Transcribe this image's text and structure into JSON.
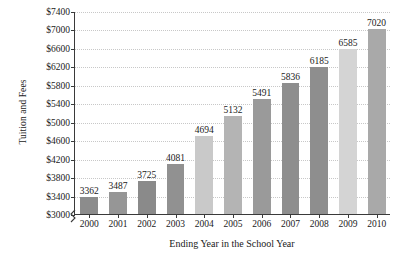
{
  "chart_data": {
    "type": "bar",
    "title": "",
    "xlabel": "Ending Year in the School Year",
    "ylabel": "Tuition and Fees",
    "categories": [
      "2000",
      "2001",
      "2002",
      "2003",
      "2004",
      "2005",
      "2006",
      "2007",
      "2008",
      "2009",
      "2010"
    ],
    "values": [
      3362,
      3487,
      3725,
      4081,
      4694,
      5132,
      5491,
      5836,
      6185,
      6585,
      7020
    ],
    "value_labels": [
      "3362",
      "3487",
      "3725",
      "4081",
      "4694",
      "5132",
      "5491",
      "5836",
      "6185",
      "6585",
      "7020"
    ],
    "ylim": [
      3000,
      7400
    ],
    "ytick_values": [
      3000,
      3400,
      3800,
      4200,
      4600,
      5000,
      5400,
      5800,
      6200,
      6600,
      7000,
      7400
    ],
    "ytick_labels": [
      "$3000",
      "$3400",
      "$3800",
      "$4200",
      "$4600",
      "$5000",
      "$5400",
      "$5800",
      "$6200",
      "$6600",
      "$7000",
      "$7400"
    ],
    "grid": true,
    "axis_break": true,
    "legend": "none",
    "bar_colors": [
      "#8c8c8c",
      "#969696",
      "#8a8a8a",
      "#919191",
      "#c9c9c9",
      "#b4b4b4",
      "#9a9a9a",
      "#8e8e8e",
      "#8e8e8e",
      "#d4d4d4",
      "#a9a9a9"
    ]
  },
  "colors": {
    "axis": "#3a3a3a",
    "gridline": "#c8c8c8",
    "background": "#ffffff",
    "text": "#1a1a1a"
  }
}
